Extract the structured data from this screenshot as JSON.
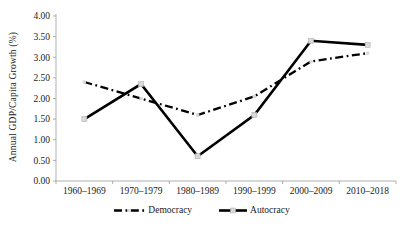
{
  "chart_data": {
    "type": "line",
    "title": "",
    "xlabel": "",
    "ylabel": "Annual GDP/Capita Growth (%)",
    "categories": [
      "1960–1969",
      "1970–1979",
      "1980–1989",
      "1990–1999",
      "2000–2009",
      "2010–2018"
    ],
    "series": [
      {
        "name": "Democracy",
        "line_style": "dash-dot",
        "values": [
          2.4,
          2.0,
          1.6,
          2.05,
          2.9,
          3.1
        ]
      },
      {
        "name": "Autocracy",
        "line_style": "solid",
        "values": [
          1.5,
          2.35,
          0.6,
          1.6,
          3.4,
          3.3
        ]
      }
    ],
    "ylim": [
      0,
      4
    ],
    "ytick_labels": [
      "0.00",
      "0.50",
      "1.00",
      "1.50",
      "2.00",
      "2.50",
      "3.00",
      "3.50",
      "4.00"
    ],
    "grid": false,
    "legend_position": "bottom",
    "colors": {
      "line": "#000000",
      "marker_fill": "#d9d9d9",
      "marker_stroke": "#b3b3b3",
      "axis": "#a6a6a6",
      "text": "#1a1a1a"
    }
  }
}
